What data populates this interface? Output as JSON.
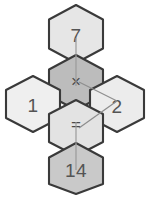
{
  "figure": {
    "background_color": "#ffffff",
    "outline_color": "#3a3a3a",
    "text_color": "#545454",
    "connector_color": "#8d8d8d"
  },
  "tiles": [
    {
      "id": "tile-top",
      "name": "hex-tile-7",
      "label": "7",
      "role": "operand",
      "fill": "#e6e6e6",
      "cx": 76,
      "cy": 34,
      "rx": 30,
      "ry": 30
    },
    {
      "id": "tile-multiply",
      "name": "hex-tile-multiply",
      "label": "×",
      "role": "operator",
      "fill": "#bcbcbc",
      "cx": 76,
      "cy": 81,
      "rx": 30,
      "ry": 30
    },
    {
      "id": "tile-left",
      "name": "hex-tile-1",
      "label": "1",
      "role": "operand",
      "fill": "#efefef",
      "cx": 32,
      "cy": 104,
      "rx": 30,
      "ry": 30
    },
    {
      "id": "tile-right",
      "name": "hex-tile-2",
      "label": "2",
      "role": "operand",
      "fill": "#ececec",
      "cx": 119,
      "cy": 104,
      "rx": 30,
      "ry": 30
    },
    {
      "id": "tile-equals",
      "name": "hex-tile-equals",
      "label": "=",
      "role": "operator",
      "fill": "#e3e3e3",
      "cx": 76,
      "cy": 122,
      "rx": 30,
      "ry": 30
    },
    {
      "id": "tile-bottom",
      "name": "hex-tile-14",
      "label": "14",
      "role": "result",
      "fill": "#c9c9c9",
      "cx": 76,
      "cy": 168,
      "rx": 30,
      "ry": 30
    }
  ],
  "connectors": [
    {
      "name": "connector-multiply-to-2",
      "from": "tile-multiply",
      "to": "tile-right",
      "x1": 78,
      "y1": 81,
      "x2": 117,
      "y2": 101
    },
    {
      "name": "connector-equals-to-2",
      "from": "tile-equals",
      "to": "tile-right",
      "x1": 78,
      "y1": 127,
      "x2": 117,
      "y2": 101
    },
    {
      "name": "spine-7-to-multiply",
      "from": "tile-top",
      "to": "tile-multiply",
      "x1": 76,
      "y1": 38,
      "x2": 76,
      "y2": 84
    },
    {
      "name": "spine-equals-to-14",
      "from": "tile-equals",
      "to": "tile-bottom",
      "x1": 76,
      "y1": 122,
      "x2": 76,
      "y2": 166
    }
  ],
  "equation": {
    "expression": "7 × 2 = 14",
    "operands": [
      "7",
      "2"
    ],
    "operator": "×",
    "result": "14",
    "unused_operand": "1"
  }
}
